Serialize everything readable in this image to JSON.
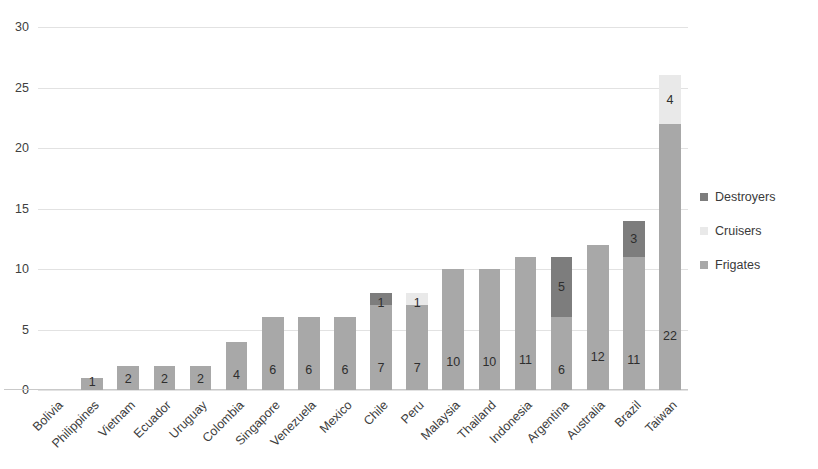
{
  "chart_data": {
    "type": "bar",
    "subtype": "stacked-column",
    "title": "",
    "xlabel": "",
    "ylabel": "",
    "ylim": [
      0,
      30
    ],
    "ytick_values": [
      0,
      5,
      10,
      15,
      20,
      25,
      30
    ],
    "ytick_labels": [
      "0",
      "5",
      "10",
      "15",
      "20",
      "25",
      "30"
    ],
    "grid": true,
    "legend_position": "right",
    "categories": [
      "Bolivia",
      "Philippines",
      "Vietnam",
      "Ecuador",
      "Uruguay",
      "Colombia",
      "Singapore",
      "Venezuela",
      "Mexico",
      "Chile",
      "Peru",
      "Malaysia",
      "Thailand",
      "Indonesia",
      "Argentina",
      "Australia",
      "Brazil",
      "Taiwan"
    ],
    "series": [
      {
        "name": "Frigates",
        "color": "#a8a8a8",
        "values": [
          0,
          1,
          2,
          2,
          2,
          4,
          6,
          6,
          6,
          7,
          7,
          10,
          10,
          11,
          6,
          12,
          11,
          22
        ]
      },
      {
        "name": "Cruisers",
        "color": "#e9e9e9",
        "values": [
          0,
          0,
          0,
          0,
          0,
          0,
          0,
          0,
          0,
          0,
          1,
          0,
          0,
          0,
          0,
          0,
          0,
          4
        ]
      },
      {
        "name": "Destroyers",
        "color": "#7d7d7d",
        "values": [
          0,
          0,
          0,
          0,
          0,
          0,
          0,
          0,
          0,
          1,
          0,
          0,
          0,
          0,
          5,
          0,
          3,
          0
        ]
      }
    ],
    "totals": [
      0,
      1,
      2,
      2,
      2,
      4,
      6,
      6,
      6,
      8,
      8,
      10,
      10,
      11,
      11,
      12,
      14,
      26
    ],
    "legend": [
      {
        "label": "Destroyers",
        "color": "#7d7d7d"
      },
      {
        "label": "Cruisers",
        "color": "#e9e9e9"
      },
      {
        "label": "Frigates",
        "color": "#a8a8a8"
      }
    ]
  }
}
